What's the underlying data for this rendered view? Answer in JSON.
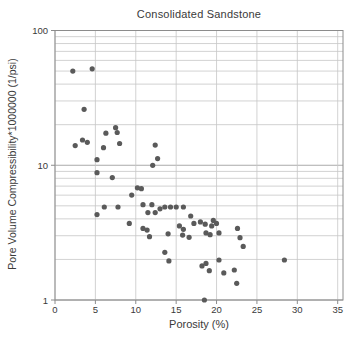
{
  "chart_data": {
    "type": "scatter",
    "title": "Consolidated Sandstone",
    "xlabel": "Porosity (%)",
    "ylabel": "Pore Volume Compressibility*1000000 (1/psi)",
    "x_ticks": [
      0,
      5,
      10,
      15,
      20,
      25,
      30,
      35
    ],
    "y_ticks": [
      1,
      10,
      100
    ],
    "xlim": [
      0,
      35
    ],
    "ylim": [
      1,
      100
    ],
    "y_scale": "log",
    "grid": true,
    "legend_position": "none",
    "colors": {
      "marker": "#5a5a5a",
      "grid": "#c6c6c6",
      "grid_major": "#ababab",
      "axis": "#8c8c8c",
      "text": "#3a3a3a"
    },
    "points": [
      [
        2.2,
        50
      ],
      [
        4.6,
        52
      ],
      [
        3.6,
        26
      ],
      [
        7.5,
        19
      ],
      [
        7.7,
        17.5
      ],
      [
        6.3,
        17.3
      ],
      [
        3.4,
        15.4
      ],
      [
        4.0,
        14.8
      ],
      [
        8.0,
        14.5
      ],
      [
        12.4,
        14.1
      ],
      [
        2.5,
        14.0
      ],
      [
        6.0,
        13.5
      ],
      [
        12.7,
        11.2
      ],
      [
        5.2,
        11.0
      ],
      [
        12.1,
        10.0
      ],
      [
        5.2,
        8.8
      ],
      [
        7.1,
        8.1
      ],
      [
        10.2,
        6.8
      ],
      [
        10.7,
        6.7
      ],
      [
        9.5,
        6.0
      ],
      [
        10.9,
        5.1
      ],
      [
        12.0,
        5.1
      ],
      [
        5.2,
        4.3
      ],
      [
        6.1,
        4.9
      ],
      [
        7.8,
        4.9
      ],
      [
        11.5,
        4.45
      ],
      [
        12.4,
        4.45
      ],
      [
        13.0,
        4.75
      ],
      [
        13.6,
        4.9
      ],
      [
        14.3,
        4.9
      ],
      [
        15.0,
        4.9
      ],
      [
        15.9,
        4.9
      ],
      [
        9.2,
        3.7
      ],
      [
        10.9,
        3.4
      ],
      [
        11.4,
        3.3
      ],
      [
        11.7,
        2.95
      ],
      [
        14.0,
        3.1
      ],
      [
        15.4,
        3.55
      ],
      [
        15.8,
        3.03
      ],
      [
        15.9,
        3.35
      ],
      [
        16.6,
        2.92
      ],
      [
        16.8,
        4.2
      ],
      [
        17.2,
        3.7
      ],
      [
        18.0,
        3.8
      ],
      [
        18.6,
        3.65
      ],
      [
        18.7,
        3.15
      ],
      [
        19.2,
        3.05
      ],
      [
        19.4,
        3.55
      ],
      [
        19.6,
        3.9
      ],
      [
        20.0,
        3.7
      ],
      [
        20.3,
        3.15
      ],
      [
        22.6,
        3.4
      ],
      [
        22.9,
        2.9
      ],
      [
        23.3,
        2.5
      ],
      [
        13.6,
        2.26
      ],
      [
        14.1,
        1.95
      ],
      [
        18.2,
        1.79
      ],
      [
        18.7,
        1.87
      ],
      [
        19.1,
        1.65
      ],
      [
        20.3,
        1.98
      ],
      [
        20.9,
        1.59
      ],
      [
        22.2,
        1.67
      ],
      [
        22.5,
        1.33
      ],
      [
        28.4,
        1.98
      ],
      [
        18.5,
        1.0
      ]
    ]
  }
}
